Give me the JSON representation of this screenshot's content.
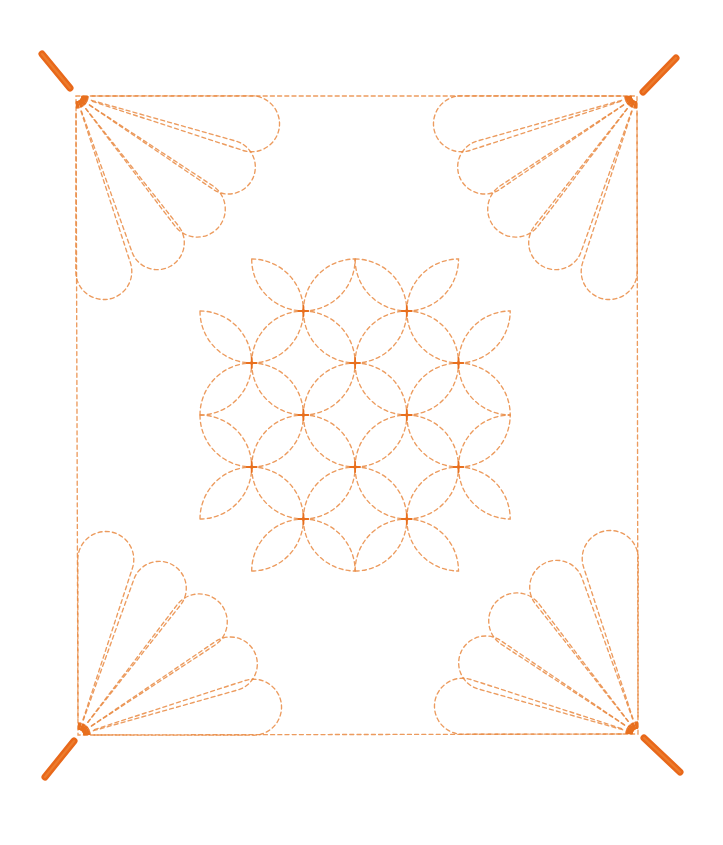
{
  "artwork": {
    "title": "Sashiko quilting pattern: shippo (seven treasures) center with corner fans and tassels",
    "background": "#ffffff",
    "stitch_color": "#e98a42",
    "knot_color": "#e8701f",
    "tassel_color": "#e8681a",
    "stitch_dash": "4 3.2",
    "stitch_width": 1.35
  },
  "border": {
    "corners": {
      "top_left": [
        76,
        96
      ],
      "top_right": [
        637,
        96
      ],
      "bottom_right": [
        638,
        734
      ],
      "bottom_left": [
        78,
        735
      ]
    }
  },
  "fans": {
    "petal_count": 5,
    "petal_axis_angles_deg": [
      9,
      25,
      43,
      61,
      81
    ],
    "petal_center_distance": [
      178,
      168,
      166,
      168,
      178
    ],
    "petal_lobe_radius": [
      28,
      27,
      28,
      27,
      28
    ],
    "start_offset": 16,
    "items": [
      {
        "name": "top-left-fan",
        "corner": "top_left",
        "sx": 1,
        "sy": 1
      },
      {
        "name": "top-right-fan",
        "corner": "top_right",
        "sx": -1,
        "sy": 1
      },
      {
        "name": "bottom-left-fan",
        "corner": "bottom_left",
        "sx": 1,
        "sy": -1
      },
      {
        "name": "bottom-right-fan",
        "corner": "bottom_right",
        "sx": -1,
        "sy": -1
      }
    ]
  },
  "tassels": [
    {
      "name": "top-left-tassel",
      "from": [
        42,
        54
      ],
      "to": [
        70,
        88
      ]
    },
    {
      "name": "top-right-tassel",
      "from": [
        676,
        58
      ],
      "to": [
        643,
        92
      ]
    },
    {
      "name": "bottom-left-tassel",
      "from": [
        74,
        741
      ],
      "to": [
        45,
        777
      ]
    },
    {
      "name": "bottom-right-tassel",
      "from": [
        644,
        738
      ],
      "to": [
        680,
        772
      ]
    }
  ],
  "shippo": {
    "origin": [
      200,
      259
    ],
    "step_x": 51.7,
    "step_y": 52.0,
    "size": 6,
    "excluded_lenses": [
      [
        [
          0,
          1
        ],
        [
          1,
          0
        ]
      ],
      [
        [
          5,
          0
        ],
        [
          6,
          1
        ]
      ],
      [
        [
          0,
          5
        ],
        [
          1,
          6
        ]
      ],
      [
        [
          5,
          6
        ],
        [
          6,
          5
        ]
      ]
    ],
    "knots": [
      [
        2,
        1
      ],
      [
        4,
        1
      ],
      [
        1,
        2
      ],
      [
        3,
        2
      ],
      [
        5,
        2
      ],
      [
        2,
        3
      ],
      [
        4,
        3
      ],
      [
        1,
        4
      ],
      [
        3,
        4
      ],
      [
        5,
        4
      ],
      [
        2,
        5
      ],
      [
        4,
        5
      ]
    ]
  }
}
